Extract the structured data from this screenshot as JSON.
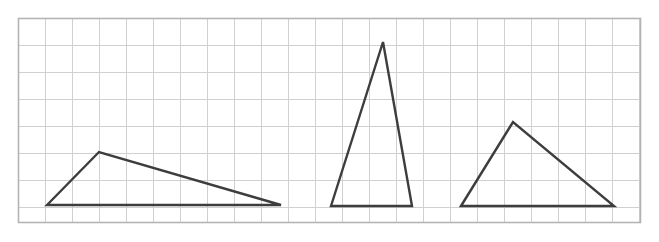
{
  "figure": {
    "canvas": {
      "width": 659,
      "height": 242
    },
    "background_color": "#ffffff"
  },
  "grid": {
    "name": "square-grid",
    "origin_x": 18,
    "origin_y": 18,
    "right": 640,
    "bottom": 222,
    "cell_size": 27,
    "columns": 23,
    "rows": 8,
    "line_color": "#d0d0d0",
    "line_width": 1,
    "border_color": "#b4b4b4",
    "border_width": 1.6
  },
  "shapes": {
    "stroke_color": "#3d3d3d",
    "stroke_width": 2.4,
    "fill": "none",
    "triangles": [
      {
        "id": "triangle-1",
        "label": "obtuse scalene triangle",
        "points": "47,205 99,152 281,205",
        "vertices": [
          {
            "name": "left-base-vertex",
            "x": 47,
            "y": 205
          },
          {
            "name": "apex-vertex",
            "x": 99,
            "y": 152
          },
          {
            "name": "right-base-vertex",
            "x": 281,
            "y": 205
          }
        ],
        "base_length_px": 234,
        "height_px": 53,
        "base_cells": 8.7,
        "height_cells": 2
      },
      {
        "id": "triangle-2",
        "label": "tall narrow acute triangle",
        "points": "331,206 383,42 412,206",
        "vertices": [
          {
            "name": "left-base-vertex",
            "x": 331,
            "y": 206
          },
          {
            "name": "apex-vertex",
            "x": 383,
            "y": 42
          },
          {
            "name": "right-base-vertex",
            "x": 412,
            "y": 206
          }
        ],
        "base_length_px": 81,
        "height_px": 164,
        "base_cells": 3,
        "height_cells": 6
      },
      {
        "id": "triangle-3",
        "label": "medium scalene triangle",
        "points": "461,206 513,122 614,206",
        "vertices": [
          {
            "name": "left-base-vertex",
            "x": 461,
            "y": 206
          },
          {
            "name": "apex-vertex",
            "x": 513,
            "y": 122
          },
          {
            "name": "right-base-vertex",
            "x": 614,
            "y": 206
          }
        ],
        "base_length_px": 153,
        "height_px": 84,
        "base_cells": 5.7,
        "height_cells": 3.1
      }
    ]
  }
}
